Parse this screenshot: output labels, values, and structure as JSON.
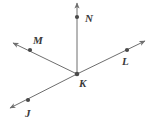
{
  "figure": {
    "name": "ray-diagram-vertex-K",
    "type": "geometry-ray-diagram",
    "width": 152,
    "height": 123,
    "background_color": "#ffffff",
    "stroke_color": "#6e6e6e",
    "point_color": "#4a4a4a",
    "label_color": "#3a3a3a",
    "stroke_width": 1,
    "vertex": {
      "label": "K",
      "x": 77,
      "y": 74,
      "label_x": 79,
      "label_y": 87
    },
    "rays": [
      {
        "label": "N",
        "direction": "up",
        "tip_x": 77,
        "tip_y": 3,
        "point_x": 77,
        "point_y": 17,
        "label_x": 85,
        "label_y": 22
      },
      {
        "label": "M",
        "direction": "up-left",
        "tip_x": 13,
        "tip_y": 43,
        "point_x": 30,
        "point_y": 50,
        "label_x": 33,
        "label_y": 44
      },
      {
        "label": "L",
        "direction": "up-right",
        "tip_x": 145,
        "tip_y": 41,
        "point_x": 127,
        "point_y": 50,
        "label_x": 122,
        "label_y": 65
      },
      {
        "label": "J",
        "direction": "down-left",
        "tip_x": 10,
        "tip_y": 108,
        "point_x": 28,
        "point_y": 100,
        "label_x": 25,
        "label_y": 117
      }
    ],
    "collinear_lines": [
      {
        "name": "line-JL",
        "through": [
          "J",
          "K",
          "L"
        ]
      }
    ]
  }
}
